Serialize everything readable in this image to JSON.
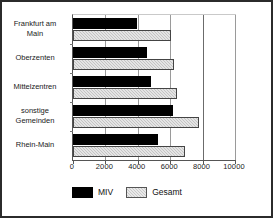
{
  "chart_data": {
    "type": "bar",
    "orientation": "horizontal",
    "title": "",
    "xlabel": "",
    "ylabel": "",
    "xlim": [
      0,
      10000
    ],
    "xticks": [
      0,
      2000,
      4000,
      6000,
      8000,
      10000
    ],
    "xtick_labels": [
      "0",
      "2000",
      "4000",
      "6000",
      "8000",
      "10000"
    ],
    "grid": true,
    "legend_position": "bottom",
    "categories": [
      "Frankfurt am\nMain",
      "Oberzenten",
      "Mittelzentren",
      "sonstige\nGemeinden",
      "Rhein-Main"
    ],
    "series": [
      {
        "name": "MIV",
        "color": "#000000",
        "values": [
          3950,
          4570,
          4820,
          6170,
          5250
        ]
      },
      {
        "name": "Gesamt",
        "color": "#c4c4c4",
        "values": [
          6050,
          6230,
          6420,
          7780,
          6910
        ]
      }
    ]
  },
  "legend": {
    "items": [
      {
        "label": "MIV"
      },
      {
        "label": "Gesamt"
      }
    ]
  }
}
